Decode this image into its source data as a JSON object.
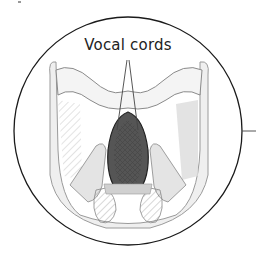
{
  "diagram": {
    "label": "Vocal cords",
    "colors": {
      "outline": "#1a1a1a",
      "tissue_light": "#ececec",
      "tissue_mid": "#c8c8c8",
      "tissue_dark": "#6a6a6a",
      "glottis": "#3a3a3a",
      "leader_line": "#555555"
    }
  }
}
